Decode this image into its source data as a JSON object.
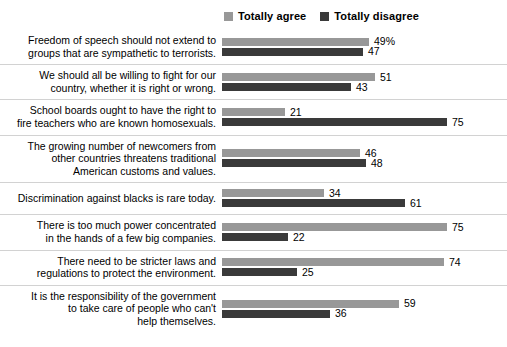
{
  "legend": {
    "items": [
      {
        "label": "Totally agree",
        "color": "#989898",
        "icon": "square-swatch-icon"
      },
      {
        "label": "Totally disagree",
        "color": "#3a3a3a",
        "icon": "square-swatch-icon"
      }
    ]
  },
  "chart_data": {
    "type": "bar",
    "orientation": "horizontal",
    "title": "",
    "xlabel": "",
    "ylabel": "",
    "xlim": [
      0,
      80
    ],
    "grid": false,
    "legend_position": "top-center",
    "value_suffix_first": "%",
    "categories": [
      "Freedom of speech should not extend to\ngroups that are sympathetic to terrorists.",
      "We should all be willing to fight for our\ncountry, whether it is right or wrong.",
      "School boards ought to have the right to\nfire teachers who are known homosexuals.",
      "The growing number of newcomers from\nother countries threatens traditional\nAmerican customs and values.",
      "Discrimination against blacks is rare today.",
      "There is too much power concentrated\nin the hands of a few big companies.",
      "There need to be stricter laws and\nregulations to protect the environment.",
      "It is the responsibility of the government\nto take care of people who can't\nhelp themselves."
    ],
    "series": [
      {
        "name": "Totally agree",
        "color": "#989898",
        "values": [
          49,
          51,
          21,
          46,
          34,
          75,
          74,
          59
        ],
        "labels": [
          "49%",
          "51",
          "21",
          "46",
          "34",
          "75",
          "74",
          "59"
        ]
      },
      {
        "name": "Totally disagree",
        "color": "#3a3a3a",
        "values": [
          47,
          43,
          75,
          48,
          61,
          22,
          25,
          36
        ],
        "labels": [
          "47",
          "43",
          "75",
          "48",
          "61",
          "22",
          "25",
          "36"
        ]
      }
    ]
  },
  "scale": {
    "px_per_unit": 3.0
  }
}
